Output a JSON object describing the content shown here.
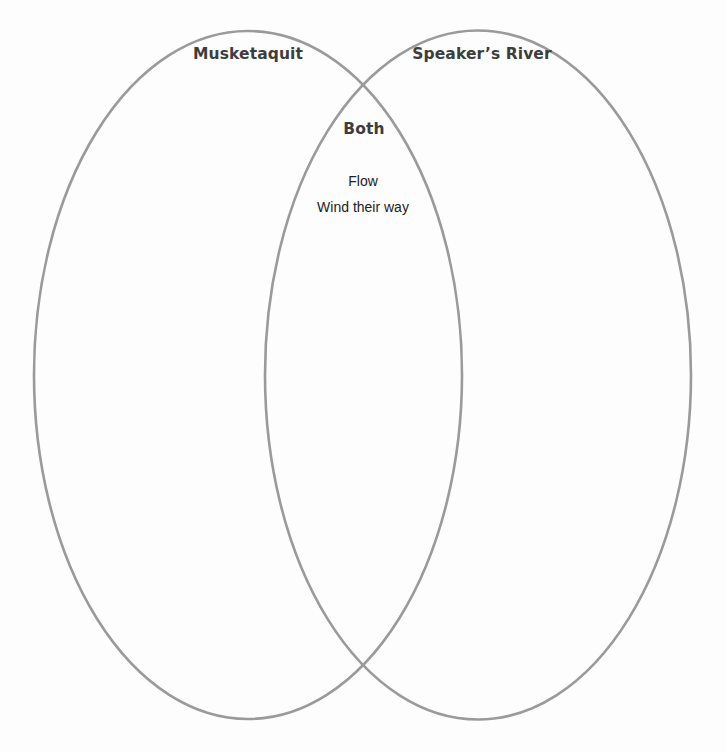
{
  "diagram": {
    "type": "venn",
    "stroke_color": "#9a9a9a",
    "sets": [
      {
        "id": "left",
        "label": "Musketaquit",
        "items": []
      },
      {
        "id": "right",
        "label": "Speaker’s River",
        "items": []
      }
    ],
    "intersection": {
      "label": "Both",
      "items": [
        "Flow",
        "Wind their way"
      ]
    }
  }
}
